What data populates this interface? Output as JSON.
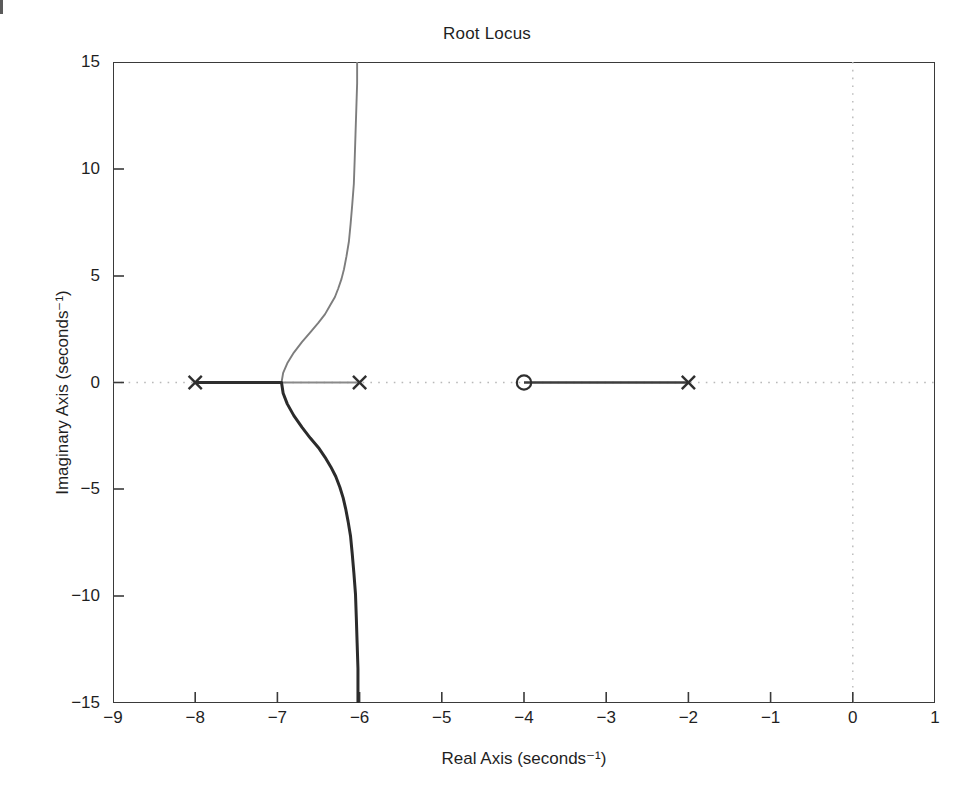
{
  "chart_data": {
    "type": "line",
    "title": "Root Locus",
    "xlabel": "Real Axis (seconds⁻¹)",
    "ylabel": "Imaginary Axis (seconds⁻¹)",
    "xlim": [
      -9,
      1
    ],
    "ylim": [
      -15,
      15
    ],
    "xticks": [
      -9,
      -8,
      -7,
      -6,
      -5,
      -4,
      -3,
      -2,
      -1,
      0,
      1
    ],
    "xtick_labels": [
      "−9",
      "−8",
      "−7",
      "−6",
      "−5",
      "−4",
      "−3",
      "−2",
      "−1",
      "0",
      "1"
    ],
    "yticks": [
      -15,
      -10,
      -5,
      0,
      5,
      10,
      15
    ],
    "ytick_labels": [
      "−15",
      "−10",
      "−5",
      "0",
      "5",
      "10",
      "15"
    ],
    "grid": "dotted-axes-only",
    "grid_lines": [
      {
        "orientation": "horizontal",
        "value": 0
      },
      {
        "orientation": "vertical",
        "value": 0
      }
    ],
    "legend": "none",
    "poles": [
      {
        "real": -8,
        "imag": 0,
        "marker": "x"
      },
      {
        "real": -6,
        "imag": 0,
        "marker": "x"
      },
      {
        "real": -2,
        "imag": 0,
        "marker": "x"
      }
    ],
    "zeros": [
      {
        "real": -4,
        "imag": 0,
        "marker": "o"
      }
    ],
    "breakaway_point": {
      "real": -6.95,
      "imag": 0
    },
    "asymptote_real": -6.0,
    "series": [
      {
        "name": "real-axis-segment-left",
        "description": "Real axis locus between pole at -8 and breakaway point near -6.95",
        "points": [
          [
            -8,
            0
          ],
          [
            -6.95,
            0
          ]
        ]
      },
      {
        "name": "real-axis-segment-right",
        "description": "Real axis locus between zero at -4 and pole at -2",
        "points": [
          [
            -4,
            0
          ],
          [
            -2,
            0
          ]
        ]
      },
      {
        "name": "upper-branch",
        "description": "Locus branch departing breakaway point into upper half plane, asymptotic to Re = -6",
        "points": [
          [
            -6.95,
            0.0
          ],
          [
            -6.93,
            0.45
          ],
          [
            -6.88,
            0.9
          ],
          [
            -6.8,
            1.4
          ],
          [
            -6.7,
            1.9
          ],
          [
            -6.6,
            2.35
          ],
          [
            -6.5,
            2.8
          ],
          [
            -6.42,
            3.2
          ],
          [
            -6.36,
            3.6
          ],
          [
            -6.3,
            4.0
          ],
          [
            -6.26,
            4.4
          ],
          [
            -6.22,
            4.85
          ],
          [
            -6.19,
            5.3
          ],
          [
            -6.16,
            5.9
          ],
          [
            -6.13,
            6.6
          ],
          [
            -6.11,
            7.4
          ],
          [
            -6.09,
            8.3
          ],
          [
            -6.07,
            9.3
          ],
          [
            -6.06,
            10.4
          ],
          [
            -6.05,
            11.6
          ],
          [
            -6.04,
            12.8
          ],
          [
            -6.03,
            14.0
          ],
          [
            -6.03,
            15.0
          ]
        ]
      },
      {
        "name": "lower-branch",
        "description": "Locus branch departing breakaway point into lower half plane, asymptotic to Re = -6",
        "points": [
          [
            -6.95,
            0.0
          ],
          [
            -6.93,
            -0.5
          ],
          [
            -6.88,
            -1.0
          ],
          [
            -6.8,
            -1.55
          ],
          [
            -6.7,
            -2.1
          ],
          [
            -6.6,
            -2.6
          ],
          [
            -6.5,
            -3.05
          ],
          [
            -6.42,
            -3.5
          ],
          [
            -6.35,
            -3.95
          ],
          [
            -6.29,
            -4.4
          ],
          [
            -6.24,
            -4.9
          ],
          [
            -6.2,
            -5.4
          ],
          [
            -6.17,
            -5.9
          ],
          [
            -6.14,
            -6.5
          ],
          [
            -6.11,
            -7.2
          ],
          [
            -6.09,
            -8.0
          ],
          [
            -6.07,
            -8.9
          ],
          [
            -6.05,
            -9.9
          ],
          [
            -6.04,
            -11.0
          ],
          [
            -6.03,
            -12.2
          ],
          [
            -6.02,
            -13.4
          ],
          [
            -6.02,
            -14.3
          ],
          [
            -6.02,
            -15.0
          ]
        ]
      }
    ],
    "colors": {
      "locus": "#2f2f2f",
      "locus_light": "#7d7d7d",
      "grid": "#b9b9b9",
      "axis": "#3a3a3a",
      "background": "#ffffff",
      "text": "#1f1f1f"
    }
  }
}
